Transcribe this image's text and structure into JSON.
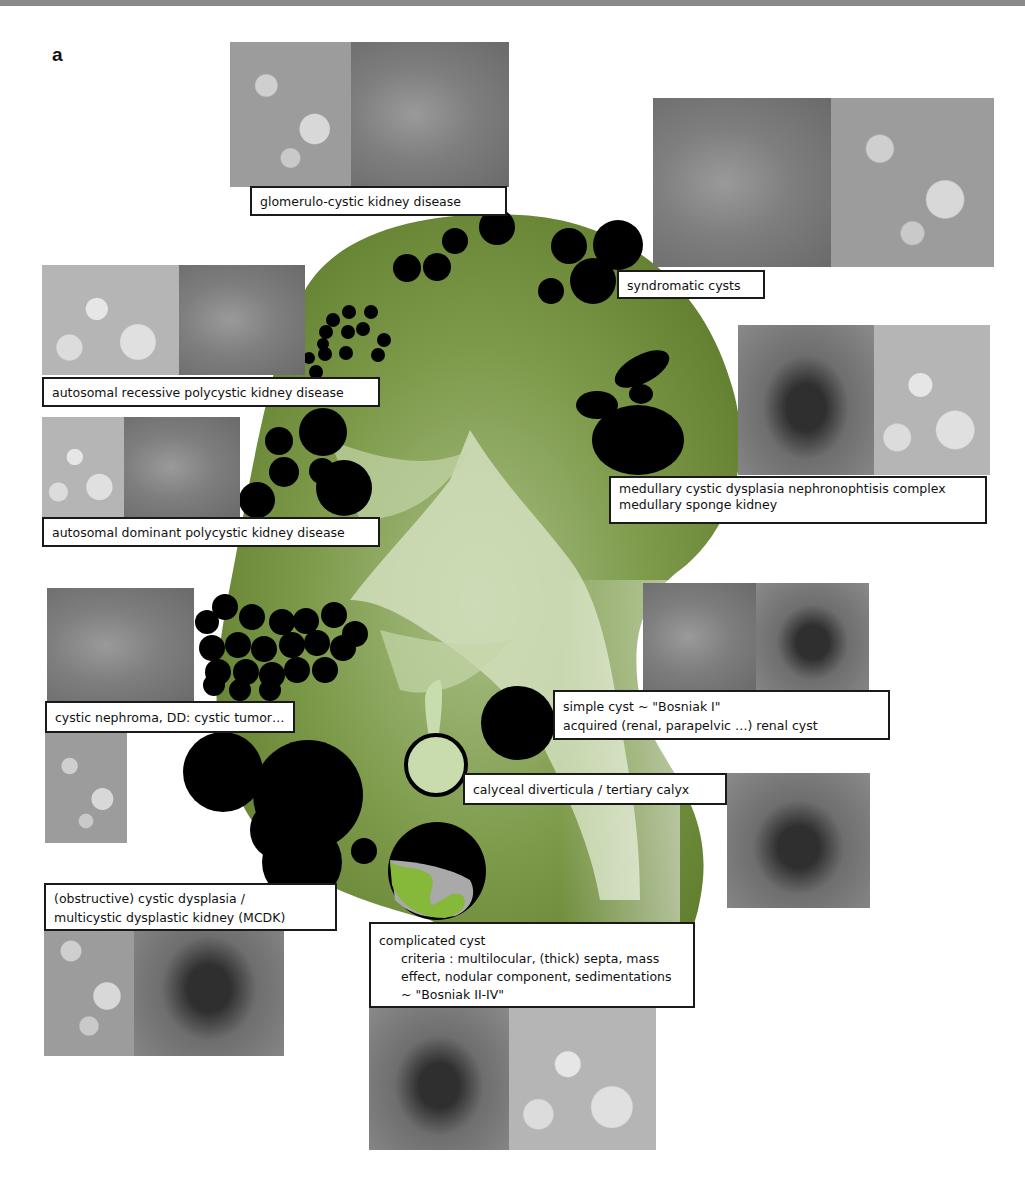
{
  "figure": {
    "panel_label": "a",
    "colors": {
      "kidney_green": "#6f8f3a",
      "kidney_light": "#c8d8b0",
      "cyst_black": "#000000",
      "label_border": "#1a1a1a",
      "calyceal_fill": "#c9dcae",
      "complicated_grey": "#a9a9a9",
      "complicated_green": "#86b83a"
    },
    "labels": {
      "glomerulocystic": "glomerulo-cystic kidney disease",
      "syndromatic": "syndromatic cysts",
      "arpkd": "autosomal recessive polycystic kidney disease",
      "adpkd": "autosomal dominant polycystic kidney disease",
      "medullary": {
        "line1": "medullary cystic dysplasia  nephronophtisis complex",
        "line2": "medullary sponge kidney"
      },
      "cystic_nephroma": "cystic nephroma, DD: cystic tumor…",
      "simple_cyst": {
        "line1": "simple cyst ~ \"Bosniak I\"",
        "line2": "acquired (renal, parapelvic …) renal cyst"
      },
      "calyceal": "calyceal diverticula / tertiary calyx",
      "mcdk": {
        "line1": "(obstructive) cystic dysplasia /",
        "line2": "multicystic dysplastic kidney (MCDK)"
      },
      "complicated": {
        "line1": "complicated cyst",
        "line2": "criteria : multilocular, (thick) septa, mass",
        "line3": "effect, nodular component,  sedimentations",
        "line4": "~  \"Bosniak II-IV\""
      }
    },
    "image_panels": [
      "glomerulocystic-histology",
      "glomerulocystic-ultrasound",
      "syndromatic-ultrasound",
      "syndromatic-histology",
      "arpkd-ultrasound",
      "arpkd-ultrasound-2",
      "adpkd-histology",
      "adpkd-ultrasound",
      "medullary-ultrasound",
      "medullary-histology",
      "cystic-nephroma-ultrasound",
      "cystic-nephroma-histology",
      "simple-cyst-ultrasound-1",
      "simple-cyst-ultrasound-2",
      "calyceal-ultrasound",
      "mcdk-histology",
      "mcdk-ultrasound",
      "complicated-ct",
      "complicated-mri"
    ]
  }
}
